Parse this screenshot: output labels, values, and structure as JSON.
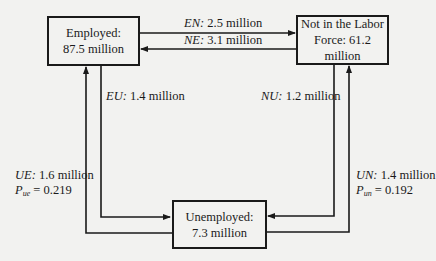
{
  "diagram": {
    "type": "labor-market-flow-diagram",
    "states": {
      "employed": {
        "line1": "Employed:",
        "line2": "87.5 million"
      },
      "not_in_labor_force": {
        "line1": "Not in the Labor",
        "line2": "Force: 61.2 million"
      },
      "unemployed": {
        "line1": "Unemployed:",
        "line2": "7.3 million"
      }
    },
    "flows": {
      "EN": {
        "code": "EN:",
        "value": "2.5 million",
        "from": "Employed",
        "to": "Not in the Labor Force"
      },
      "NE": {
        "code": "NE:",
        "value": "3.1 million",
        "from": "Not in the Labor Force",
        "to": "Employed"
      },
      "EU": {
        "code": "EU:",
        "value": "1.4 million",
        "from": "Employed",
        "to": "Unemployed"
      },
      "NU": {
        "code": "NU:",
        "value": "1.2 million",
        "from": "Not in the Labor Force",
        "to": "Unemployed"
      },
      "UE": {
        "code": "UE:",
        "value": "1.6 million",
        "from": "Unemployed",
        "to": "Employed",
        "prob_symbol": "P",
        "prob_sub": "ue",
        "prob_eq": "= 0.219"
      },
      "UN": {
        "code": "UN:",
        "value": "1.4 million",
        "from": "Unemployed",
        "to": "Not in the Labor Force",
        "prob_symbol": "P",
        "prob_sub": "un",
        "prob_eq": "= 0.192"
      }
    },
    "colors": {
      "background": "#f2f2f0",
      "stroke": "#1a1a1a"
    }
  }
}
